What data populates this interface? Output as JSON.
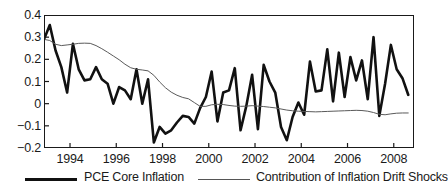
{
  "chart_data": {
    "type": "line",
    "title": "",
    "xlabel": "",
    "ylabel": "",
    "xlim": [
      1992.875,
      2008.875
    ],
    "ylim": [
      -0.2,
      0.4
    ],
    "grid": false,
    "legend_position": "bottom",
    "yticks": [
      0.4,
      0.3,
      0.2,
      0.1,
      0,
      -0.1,
      -0.2
    ],
    "ytick_labels": [
      "0.4",
      "0.3",
      "0.2",
      "0.1",
      "0",
      "−0.1",
      "−0.2"
    ],
    "xticks": [
      1994,
      1996,
      1998,
      2000,
      2002,
      2004,
      2006,
      2008
    ],
    "xtick_labels": [
      "1994",
      "1996",
      "1998",
      "2000",
      "2002",
      "2004",
      "2006",
      "2008"
    ],
    "series": [
      {
        "name": "PCE Core Inflation",
        "color": "#111111",
        "width": 2.6,
        "x": [
          1992.875,
          1993.125,
          1993.375,
          1993.625,
          1993.875,
          1994.125,
          1994.375,
          1994.625,
          1994.875,
          1995.125,
          1995.375,
          1995.625,
          1995.875,
          1996.125,
          1996.375,
          1996.625,
          1996.875,
          1997.125,
          1997.375,
          1997.625,
          1997.875,
          1998.125,
          1998.375,
          1998.625,
          1998.875,
          1999.125,
          1999.375,
          1999.625,
          1999.875,
          2000.125,
          2000.375,
          2000.625,
          2000.875,
          2001.125,
          2001.375,
          2001.625,
          2001.875,
          2002.125,
          2002.375,
          2002.625,
          2002.875,
          2003.125,
          2003.375,
          2003.625,
          2003.875,
          2004.125,
          2004.375,
          2004.625,
          2004.875,
          2005.125,
          2005.375,
          2005.625,
          2005.875,
          2006.125,
          2006.375,
          2006.625,
          2006.875,
          2007.125,
          2007.375,
          2007.625,
          2007.875,
          2008.125,
          2008.375,
          2008.625
        ],
        "values": [
          0.29,
          0.355,
          0.24,
          0.165,
          0.05,
          0.27,
          0.155,
          0.105,
          0.11,
          0.165,
          0.11,
          0.09,
          0.0,
          0.075,
          0.06,
          0.02,
          0.155,
          0.0,
          0.11,
          -0.175,
          -0.105,
          -0.135,
          -0.12,
          -0.085,
          -0.055,
          -0.06,
          -0.09,
          -0.02,
          0.03,
          0.145,
          -0.08,
          0.05,
          0.06,
          0.16,
          -0.12,
          -0.01,
          0.13,
          -0.115,
          0.175,
          0.1,
          0.05,
          -0.105,
          -0.165,
          -0.06,
          0.005,
          -0.05,
          0.19,
          0.055,
          0.06,
          0.245,
          0.01,
          0.23,
          0.03,
          0.21,
          0.105,
          0.195,
          0.02,
          0.3,
          -0.055,
          0.09,
          0.265,
          0.155,
          0.115,
          0.04
        ]
      },
      {
        "name": "Contribution of Inflation Drift Shocks",
        "color": "#5a5a5a",
        "width": 1.0,
        "x": [
          1992.875,
          1993.125,
          1993.375,
          1993.625,
          1993.875,
          1994.125,
          1994.375,
          1994.625,
          1994.875,
          1995.125,
          1995.375,
          1995.625,
          1995.875,
          1996.125,
          1996.375,
          1996.625,
          1996.875,
          1997.125,
          1997.375,
          1997.625,
          1997.875,
          1998.125,
          1998.375,
          1998.625,
          1998.875,
          1999.125,
          1999.375,
          1999.625,
          1999.875,
          2000.125,
          2000.375,
          2000.625,
          2000.875,
          2001.125,
          2001.375,
          2001.625,
          2001.875,
          2002.125,
          2002.375,
          2002.625,
          2002.875,
          2003.125,
          2003.375,
          2003.625,
          2003.875,
          2004.125,
          2004.375,
          2004.625,
          2004.875,
          2005.125,
          2005.375,
          2005.625,
          2005.875,
          2006.125,
          2006.375,
          2006.625,
          2006.875,
          2007.125,
          2007.375,
          2007.625,
          2007.875,
          2008.125,
          2008.375,
          2008.625
        ],
        "values": [
          0.29,
          0.285,
          0.268,
          0.262,
          0.265,
          0.268,
          0.272,
          0.273,
          0.272,
          0.262,
          0.248,
          0.232,
          0.215,
          0.198,
          0.178,
          0.162,
          0.155,
          0.152,
          0.148,
          0.128,
          0.098,
          0.072,
          0.052,
          0.038,
          0.028,
          0.022,
          0.005,
          -0.012,
          -0.012,
          -0.005,
          -0.003,
          -0.004,
          -0.008,
          -0.011,
          -0.012,
          -0.011,
          -0.009,
          -0.011,
          -0.013,
          -0.016,
          -0.019,
          -0.024,
          -0.029,
          -0.032,
          -0.034,
          -0.035,
          -0.036,
          -0.037,
          -0.036,
          -0.035,
          -0.034,
          -0.033,
          -0.032,
          -0.031,
          -0.03,
          -0.031,
          -0.034,
          -0.04,
          -0.048,
          -0.05,
          -0.046,
          -0.043,
          -0.042,
          -0.042
        ]
      }
    ]
  },
  "legend": {
    "items": [
      {
        "label": "PCE Core Inflation",
        "style": "thick-black"
      },
      {
        "label": "Contribution of Inflation Drift Shocks",
        "style": "thin-gray"
      }
    ]
  }
}
